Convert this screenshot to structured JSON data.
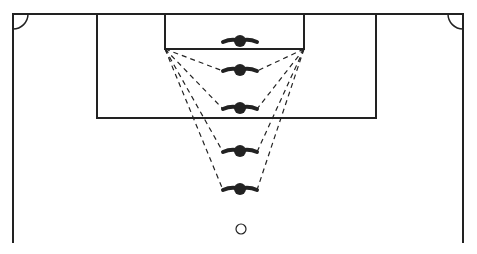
{
  "diagram": {
    "type": "football-pitch-drill",
    "colors": {
      "line": "#222222",
      "background": "#ffffff"
    },
    "pitch": {
      "top_line_y": 14,
      "left_x": 13,
      "right_x": 463,
      "bottom_y": 243
    },
    "penalty_area": {
      "x1": 97,
      "x2": 376,
      "y1": 14,
      "y2": 118
    },
    "goal_area": {
      "x1": 165,
      "x2": 304,
      "y1": 14,
      "y2": 49
    },
    "corner_arcs": [
      {
        "cx": 13,
        "cy": 14,
        "r": 15
      },
      {
        "cx": 463,
        "cy": 14,
        "r": 15
      }
    ],
    "players": [
      {
        "id": "p1",
        "x": 240,
        "y": 41
      },
      {
        "id": "p2",
        "x": 240,
        "y": 70
      },
      {
        "id": "p3",
        "x": 240,
        "y": 108
      },
      {
        "id": "p4",
        "x": 240,
        "y": 151
      },
      {
        "id": "p5",
        "x": 240,
        "y": 189
      }
    ],
    "ball": {
      "x": 241,
      "y": 229,
      "r": 5
    },
    "dashed_lines_from": [
      {
        "x": 165,
        "y": 49
      },
      {
        "x": 304,
        "y": 49
      }
    ]
  }
}
